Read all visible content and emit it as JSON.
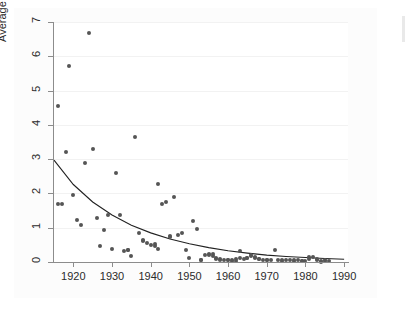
{
  "chart_data": {
    "type": "scatter",
    "title": "",
    "subtitle": "",
    "xlabel": "",
    "ylabel": "Average number of lives lost",
    "xlim": [
      1915,
      1991
    ],
    "ylim": [
      0,
      7
    ],
    "grid": true,
    "grid_orientation": "horizontal",
    "legend": "none",
    "marker_color": "#555555",
    "fit_line_color": "#222222",
    "axis_color": "#8c8c8c",
    "panel_color": "#fcfcfc",
    "xticks": [
      1920,
      1930,
      1940,
      1950,
      1960,
      1970,
      1980,
      1990
    ],
    "xtick_labels": [
      "1920",
      "1930",
      "1940",
      "1950",
      "1960",
      "1970",
      "1980",
      "1990"
    ],
    "yticks": [
      0,
      1,
      2,
      3,
      4,
      5,
      6,
      7
    ],
    "ytick_labels": [
      "0",
      "1",
      "2",
      "3",
      "4",
      "5",
      "6",
      "7"
    ],
    "series": [
      {
        "name": "Average number of lives lost",
        "type": "scatter",
        "x": [
          1916,
          1916,
          1917,
          1918,
          1919,
          1920,
          1921,
          1922,
          1923,
          1924,
          1925,
          1926,
          1927,
          1928,
          1929,
          1930,
          1931,
          1932,
          1933,
          1934,
          1934,
          1935,
          1936,
          1937,
          1938,
          1938,
          1939,
          1940,
          1941,
          1941,
          1942,
          1942,
          1943,
          1944,
          1945,
          1945,
          1946,
          1947,
          1948,
          1949,
          1950,
          1951,
          1952,
          1953,
          1953,
          1954,
          1955,
          1955,
          1956,
          1956,
          1957,
          1957,
          1958,
          1958,
          1959,
          1960,
          1960,
          1961,
          1961,
          1962,
          1962,
          1963,
          1963,
          1964,
          1965,
          1965,
          1966,
          1966,
          1967,
          1967,
          1968,
          1968,
          1969,
          1970,
          1970,
          1971,
          1972,
          1973,
          1974,
          1974,
          1975,
          1976,
          1977,
          1977,
          1978,
          1979,
          1979,
          1980,
          1981,
          1981,
          1982,
          1983,
          1983,
          1984,
          1984,
          1985,
          1985,
          1986
        ],
        "y": [
          1.68,
          4.55,
          1.68,
          3.2,
          5.72,
          1.94,
          1.22,
          1.08,
          2.9,
          6.67,
          3.3,
          1.28,
          0.47,
          0.93,
          1.37,
          0.38,
          2.6,
          1.37,
          0.32,
          0.35,
          0.36,
          0.18,
          3.64,
          0.85,
          0.63,
          0.6,
          0.55,
          0.5,
          0.48,
          0.52,
          0.37,
          2.27,
          1.7,
          1.74,
          0.72,
          0.75,
          1.89,
          0.8,
          0.84,
          0.35,
          0.12,
          1.2,
          0.95,
          0.05,
          0.07,
          0.2,
          0.22,
          0.2,
          0.18,
          0.22,
          0.1,
          0.12,
          0.07,
          0.1,
          0.05,
          0.07,
          0.05,
          0.02,
          0.05,
          0.02,
          0.1,
          0.12,
          0.32,
          0.1,
          0.12,
          0.13,
          0.18,
          0.2,
          0.15,
          0.12,
          0.1,
          0.1,
          0.05,
          0.05,
          0.07,
          0.05,
          0.36,
          0.05,
          0.05,
          0.03,
          0.05,
          0.05,
          0.04,
          0.05,
          0.05,
          0.04,
          0.04,
          0.03,
          0.1,
          0.14,
          0.16,
          0.1,
          0.05,
          0.0,
          0.02,
          0.03,
          0.05,
          0.02
        ]
      },
      {
        "name": "Fitted exponential trend",
        "type": "line",
        "x": [
          1915,
          1920,
          1925,
          1930,
          1935,
          1940,
          1945,
          1950,
          1955,
          1960,
          1965,
          1970,
          1975,
          1980,
          1985,
          1990
        ],
        "y": [
          2.97,
          2.26,
          1.75,
          1.37,
          1.07,
          0.85,
          0.67,
          0.53,
          0.42,
          0.33,
          0.26,
          0.2,
          0.16,
          0.13,
          0.1,
          0.08
        ]
      }
    ]
  }
}
